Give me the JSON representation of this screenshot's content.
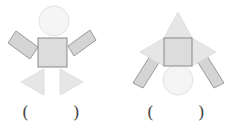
{
  "figures": [
    {
      "id": "figure-1",
      "description": "Figure made of a circle head, square body, two rectangle arms and two triangle legs",
      "shapes": {
        "circle": 1,
        "square": 1,
        "rectangle": 2,
        "triangle": 2
      },
      "answer_blank": {
        "open": "(",
        "close": ")",
        "value": ""
      }
    },
    {
      "id": "figure-2",
      "description": "Figure made of a top triangle, square body, two side triangles, two rectangle legs and a circle",
      "shapes": {
        "circle": 1,
        "square": 1,
        "rectangle": 2,
        "triangle": 3
      },
      "answer_blank": {
        "open": "(",
        "close": ")",
        "value": ""
      }
    }
  ],
  "colors": {
    "circle_fill": "#f5f5f5",
    "circle_stroke": "#e2e2e2",
    "square_fill": "#dcdcdc",
    "square_stroke": "#8a8a8a",
    "rect_fill": "#d4d4d4",
    "rect_stroke": "#9a9a9a",
    "triangle_fill": "#e6e6e6",
    "triangle_stroke": "#e0e0e0",
    "paren_color": "#444444"
  }
}
